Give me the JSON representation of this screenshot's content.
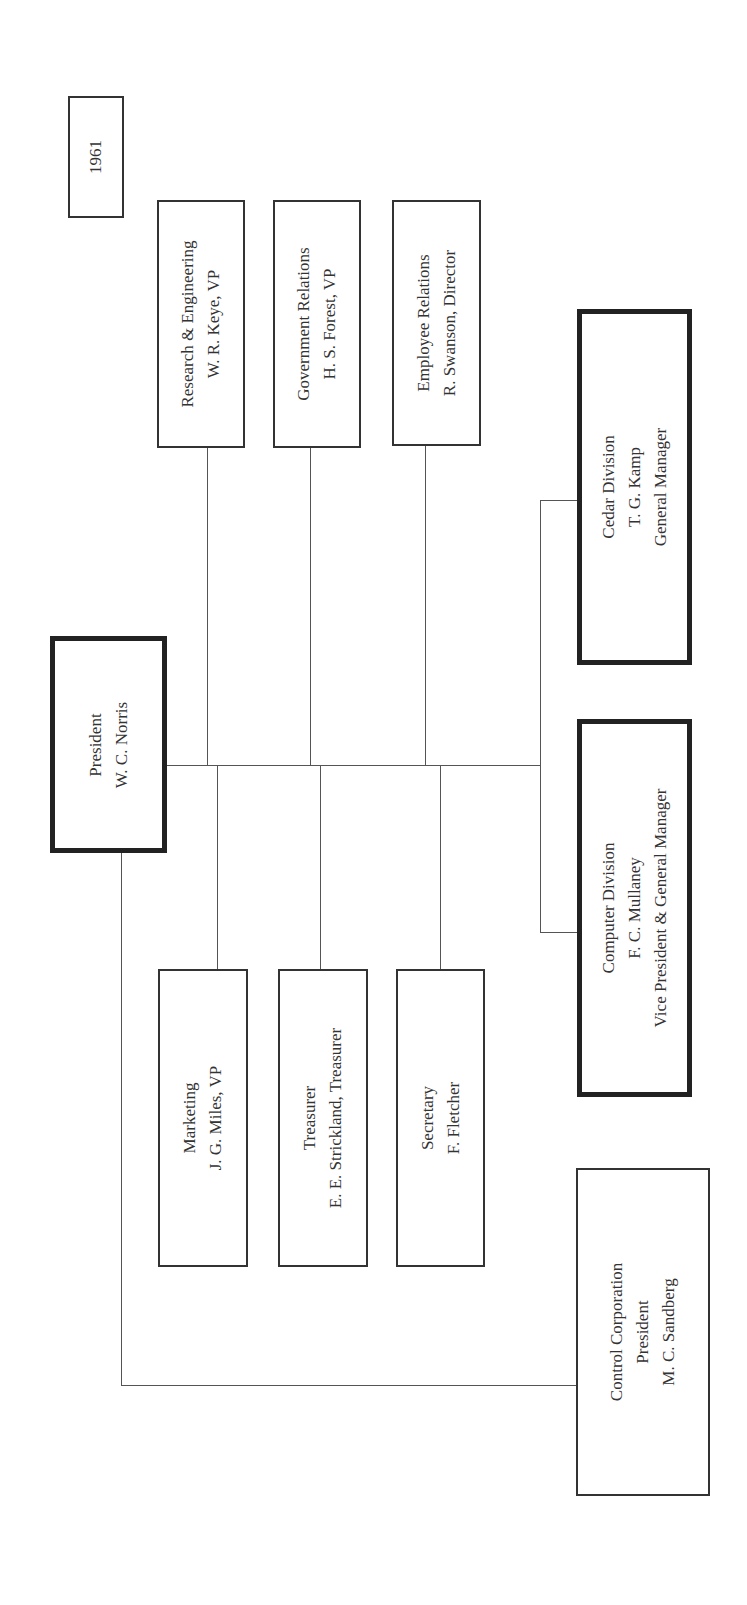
{
  "chart": {
    "year": "1961",
    "president": {
      "title": "President",
      "name": "W. C. Norris"
    },
    "staff_top": [
      {
        "title": "Research & Engineering",
        "name": "W. R. Keye, VP"
      },
      {
        "title": "Government Relations",
        "name": "H. S. Forest, VP"
      },
      {
        "title": "Employee Relations",
        "name": "R. Swanson, Director"
      }
    ],
    "staff_bottom": [
      {
        "title": "Marketing",
        "name": "J. G. Miles, VP"
      },
      {
        "title": "Treasurer",
        "name": "E. E. Strickland, Treasurer"
      },
      {
        "title": "Secretary",
        "name": "F. Fletcher"
      }
    ],
    "divisions": [
      {
        "title": "Cedar Division",
        "name": "T. G. Kamp",
        "role": "General Manager"
      },
      {
        "title": "Computer Division",
        "name": "F. C. Mullaney",
        "role": "Vice President & General Manager"
      }
    ],
    "subsidiary": {
      "title": "Control Corporation",
      "role": "President",
      "name": "M. C. Sandberg"
    }
  }
}
